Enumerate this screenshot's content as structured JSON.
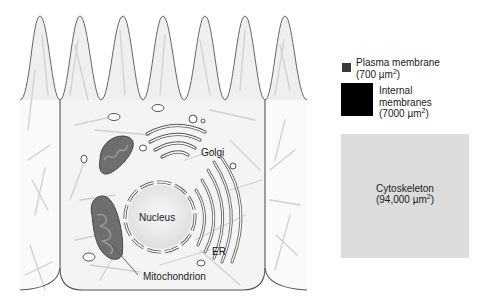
{
  "figure": {
    "type": "cell-membrane-area-comparison",
    "labels": {
      "golgi": "Golgi",
      "nucleus": "Nucleus",
      "er": "ER",
      "mitochondrion": "Mitochondrion"
    }
  },
  "legend": {
    "items": [
      {
        "name": "Plasma membrane",
        "value": "700",
        "unit": "µm",
        "exp": "2",
        "color": "#3a3a3a"
      },
      {
        "name_line1": "Internal",
        "name_line2": "membranes",
        "value": "7000",
        "unit": "µm",
        "exp": "2",
        "color": "#000000"
      },
      {
        "name": "Cytoskeleton",
        "value": "94,000",
        "unit": "µm",
        "exp": "2",
        "color": "#dcdcdc"
      }
    ]
  },
  "colors": {
    "membrane_line": "#555555",
    "cytoskeleton_line": "#d2d2d2",
    "cell_fill": "#f3f3f3",
    "mitochondrion_fill": "#6e6e6e",
    "nucleus_fill": "#e6e6e6"
  }
}
